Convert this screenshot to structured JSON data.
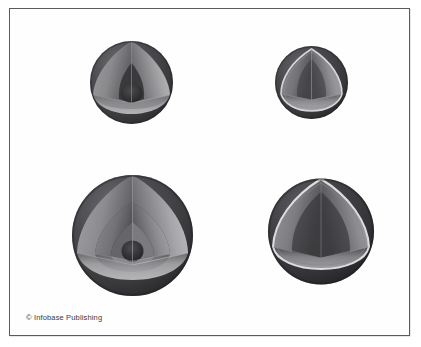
{
  "figure": {
    "background_color": "#ffffff",
    "frame_color": "#5b5b5e",
    "width": 421,
    "height": 347,
    "title": "",
    "credit": "© Infobase Publishing"
  },
  "diagram": {
    "type": "cutaway-sphere-set",
    "palette": {
      "mantle_dark": "#3a3a3c",
      "surface_dark": "#2f2f31",
      "cut_face_light": "#b9b9bb",
      "cut_face_mid": "#8d8d90",
      "core_dark": "#2a2a2c",
      "highlight_rim": "#d8d8da"
    },
    "planets": [
      {
        "id": "planet-top-left",
        "label": "",
        "cx": 121.5,
        "cy": 73.5,
        "radius": 41.5,
        "layer_count": 3,
        "layer_radii": [
          41.5,
          29.0,
          11.0
        ],
        "rim_highlight": false
      },
      {
        "id": "planet-top-right",
        "label": "",
        "cx": 304.0,
        "cy": 74.5,
        "radius": 36.5,
        "layer_count": 2,
        "layer_radii": [
          36.5,
          30.0
        ],
        "rim_highlight": true
      },
      {
        "id": "planet-bottom-left",
        "label": "",
        "cx": 122.5,
        "cy": 226.5,
        "radius": 60.5,
        "layer_count": 4,
        "layer_radii": [
          60.5,
          47.0,
          31.0,
          10.0
        ],
        "rim_highlight": false
      },
      {
        "id": "planet-bottom-right",
        "label": "",
        "cx": 310.5,
        "cy": 222.5,
        "radius": 53.0,
        "layer_count": 2,
        "layer_radii": [
          53.0,
          45.0
        ],
        "rim_highlight": true
      }
    ]
  }
}
